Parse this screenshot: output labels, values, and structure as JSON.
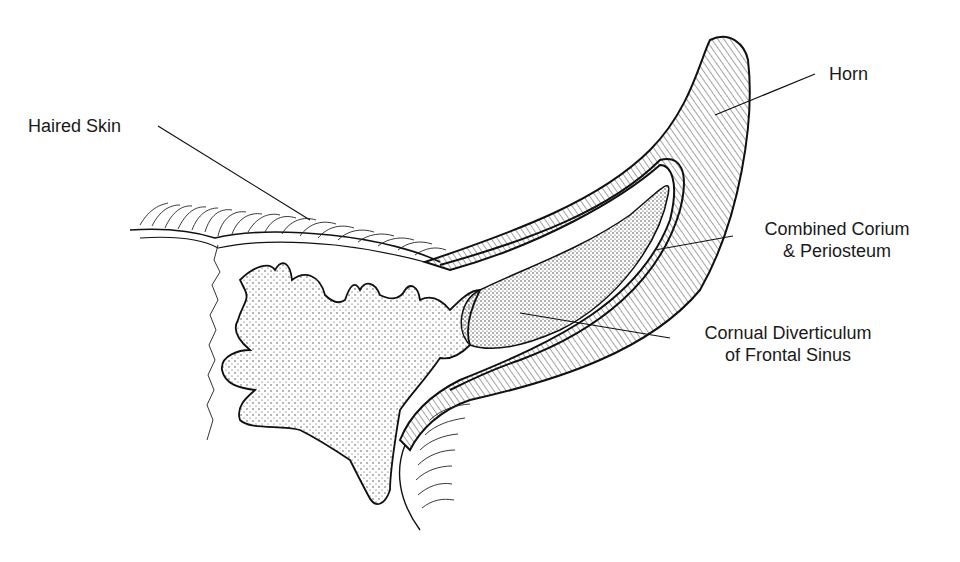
{
  "diagram": {
    "labels": [
      {
        "id": "haired-skin",
        "text": "Haired Skin"
      },
      {
        "id": "horn",
        "text": "Horn"
      },
      {
        "id": "corium",
        "line1": "Combined Corium",
        "line2": "& Periosteum"
      },
      {
        "id": "cornual",
        "line1": "Cornual Diverticulum",
        "line2": "of Frontal Sinus"
      }
    ],
    "colors": {
      "ink": "#1a1a1a",
      "background": "#ffffff"
    }
  }
}
